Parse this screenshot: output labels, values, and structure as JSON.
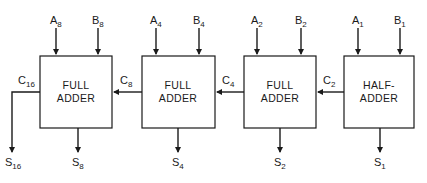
{
  "diagram": {
    "type": "binary adder chain (ripple carry)",
    "blocks": [
      {
        "id": "fa8",
        "line1": "FULL",
        "line2": "ADDER",
        "in_a": "A",
        "in_a_sub": "8",
        "in_b": "B",
        "in_b_sub": "8",
        "sum": "S",
        "sum_sub": "8",
        "carry_out": "C",
        "carry_out_sub": "16",
        "sum_carry": "S",
        "sum_carry_sub": "16"
      },
      {
        "id": "fa4",
        "line1": "FULL",
        "line2": "ADDER",
        "in_a": "A",
        "in_a_sub": "4",
        "in_b": "B",
        "in_b_sub": "4",
        "sum": "S",
        "sum_sub": "4",
        "carry_out": "C",
        "carry_out_sub": "8"
      },
      {
        "id": "fa2",
        "line1": "FULL",
        "line2": "ADDER",
        "in_a": "A",
        "in_a_sub": "2",
        "in_b": "B",
        "in_b_sub": "2",
        "sum": "S",
        "sum_sub": "2",
        "carry_out": "C",
        "carry_out_sub": "4"
      },
      {
        "id": "ha1",
        "line1": "HALF-",
        "line2": "ADDER",
        "in_a": "A",
        "in_a_sub": "1",
        "in_b": "B",
        "in_b_sub": "1",
        "sum": "S",
        "sum_sub": "1",
        "carry_out": "C",
        "carry_out_sub": "2"
      }
    ]
  }
}
